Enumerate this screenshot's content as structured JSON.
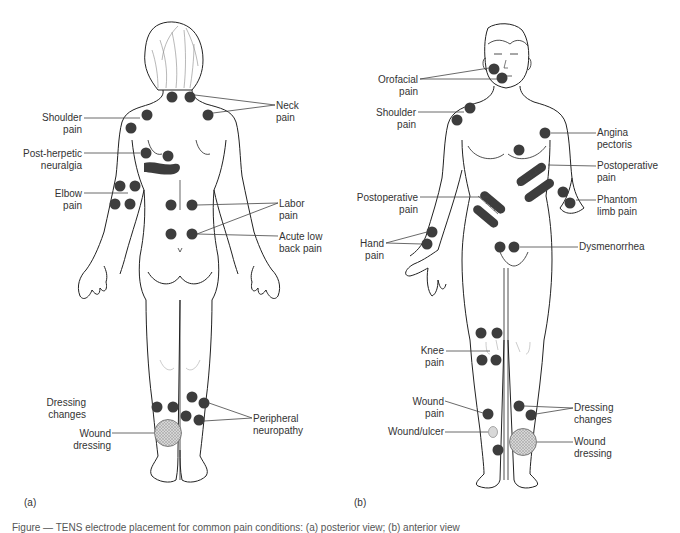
{
  "colors": {
    "outline": "#222222",
    "dot": "#3d3d3d",
    "leader": "#444444",
    "dressing_fill": "#c8c8c8",
    "label_text": "#333333"
  },
  "panel_a": {
    "tag": "(a)",
    "view": "posterior",
    "labels": {
      "neck": [
        "Neck",
        "pain"
      ],
      "shoulder": [
        "Shoulder",
        "pain"
      ],
      "post_herpetic": [
        "Post-herpetic",
        "neuralgia"
      ],
      "elbow": [
        "Elbow",
        "pain"
      ],
      "labor": [
        "Labor",
        "pain"
      ],
      "acute_low_back": [
        "Acute low",
        "back pain"
      ],
      "dressing_changes": [
        "Dressing",
        "changes"
      ],
      "wound_dressing": [
        "Wound",
        "dressing"
      ],
      "peripheral_neuropathy": [
        "Peripheral",
        "neuropathy"
      ]
    }
  },
  "panel_b": {
    "tag": "(b)",
    "view": "anterior",
    "labels": {
      "orofacial": [
        "Orofacial",
        "pain"
      ],
      "shoulder": [
        "Shoulder",
        "pain"
      ],
      "angina": [
        "Angina",
        "pectoris"
      ],
      "postop_right": [
        "Postoperative",
        "pain"
      ],
      "postop_left": [
        "Postoperative",
        "pain"
      ],
      "phantom": [
        "Phantom",
        "limb pain"
      ],
      "hand": [
        "Hand",
        "pain"
      ],
      "dysmenorrhea": [
        "Dysmenorrhea"
      ],
      "knee": [
        "Knee",
        "pain"
      ],
      "wound_pain": [
        "Wound",
        "pain"
      ],
      "wound_ulcer": [
        "Wound/ulcer"
      ],
      "dressing_changes": [
        "Dressing",
        "changes"
      ],
      "wound_dressing": [
        "Wound",
        "dressing"
      ]
    }
  },
  "caption": "Figure — TENS electrode placement for common pain conditions: (a) posterior view; (b) anterior view"
}
